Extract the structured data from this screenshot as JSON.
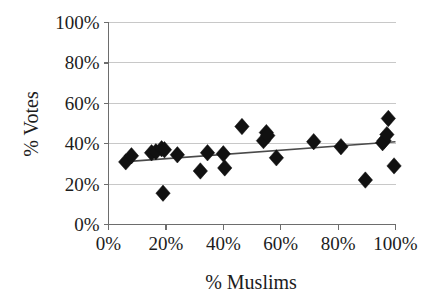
{
  "chart_data": {
    "type": "scatter",
    "title": "",
    "xlabel": "% Muslims",
    "ylabel": "% Votes",
    "xlim": [
      0,
      100
    ],
    "ylim": [
      0,
      100
    ],
    "grid": true,
    "legend": null,
    "x_ticks": [
      "0%",
      "20%",
      "40%",
      "60%",
      "80%",
      "100%"
    ],
    "x_tick_values": [
      0,
      20,
      40,
      60,
      80,
      100
    ],
    "y_ticks": [
      "0%",
      "20%",
      "40%",
      "60%",
      "80%",
      "100%"
    ],
    "y_tick_values": [
      0,
      20,
      40,
      60,
      80,
      100
    ],
    "marker": "diamond",
    "marker_color": "#111111",
    "points": [
      {
        "x": 6.0,
        "y": 31.0
      },
      {
        "x": 8.0,
        "y": 34.0
      },
      {
        "x": 15.0,
        "y": 35.5
      },
      {
        "x": 16.5,
        "y": 36.0
      },
      {
        "x": 18.5,
        "y": 37.5
      },
      {
        "x": 19.0,
        "y": 15.5
      },
      {
        "x": 19.5,
        "y": 37.0
      },
      {
        "x": 24.0,
        "y": 34.5
      },
      {
        "x": 32.0,
        "y": 26.5
      },
      {
        "x": 34.5,
        "y": 35.5
      },
      {
        "x": 40.0,
        "y": 35.0
      },
      {
        "x": 40.5,
        "y": 28.0
      },
      {
        "x": 46.5,
        "y": 48.5
      },
      {
        "x": 54.0,
        "y": 41.5
      },
      {
        "x": 55.0,
        "y": 45.5
      },
      {
        "x": 55.5,
        "y": 44.0
      },
      {
        "x": 58.5,
        "y": 33.0
      },
      {
        "x": 71.5,
        "y": 41.0
      },
      {
        "x": 81.0,
        "y": 38.5
      },
      {
        "x": 89.5,
        "y": 22.0
      },
      {
        "x": 95.5,
        "y": 40.5
      },
      {
        "x": 96.0,
        "y": 41.5
      },
      {
        "x": 97.0,
        "y": 44.5
      },
      {
        "x": 97.5,
        "y": 52.5
      },
      {
        "x": 99.5,
        "y": 29.0
      }
    ],
    "trendline": {
      "type": "linear",
      "x_start": 5.0,
      "y_start": 31.0,
      "x_end": 100.0,
      "y_end": 41.0,
      "color": "#4a4a4a"
    }
  }
}
